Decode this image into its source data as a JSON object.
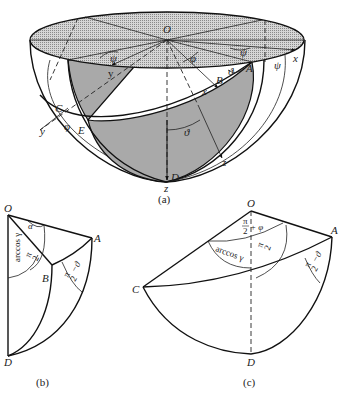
{
  "figures": [
    {
      "id": "a",
      "caption": "(a)",
      "description": "Hemisphere with shaded equatorial disk and spherical triangle regions",
      "points": {
        "O": "O",
        "A": "A",
        "B": "B",
        "C": "C",
        "D": "D",
        "E": "E"
      },
      "axes": {
        "x_upper": "x",
        "x_lower": "x",
        "y_upper": "y",
        "y_lower": "y",
        "z_lower": "z",
        "z_bottom": "z"
      },
      "angles": {
        "psi_top_left": "ψ",
        "psi_top_right": "ψ",
        "psi_right": "ψ",
        "phi_center": "φ",
        "phi_left": "φ",
        "theta_A": "ϑ",
        "theta_center": "ϑ"
      }
    },
    {
      "id": "b",
      "caption": "(b)",
      "points": {
        "O": "O",
        "A": "A",
        "B": "B",
        "D": "D"
      },
      "angles": {
        "alpha": "α",
        "arccos": "arccos γ",
        "pi_half": "π/2",
        "pi_half_minus_theta": "π/2 − ϑ"
      }
    },
    {
      "id": "c",
      "caption": "(c)",
      "points": {
        "O": "O",
        "A": "A",
        "C": "C",
        "D": "D"
      },
      "angles": {
        "pi_half_plus_phi": "π/2 + φ",
        "arccos": "arccos γ",
        "pi_half": "π/2",
        "pi_half_minus_theta": "π/2 − ϑ"
      }
    }
  ],
  "labels": {
    "pi": "π",
    "two": "2",
    "plus_phi": "+ φ",
    "minus_theta": "−ϑ",
    "arccos_gamma": "arccos γ"
  },
  "colors": {
    "disk_fill": "#c8c8c8",
    "shade_fill": "#a9a9a9",
    "stroke": "#111111"
  }
}
